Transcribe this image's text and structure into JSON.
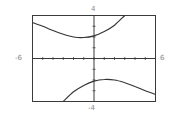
{
  "chart_data": {
    "type": "line",
    "title": "",
    "xlabel": "",
    "ylabel": "",
    "xlim": [
      -6,
      6
    ],
    "ylim": [
      -4,
      4
    ],
    "grid": false,
    "tick_labels": {
      "xmin": "-6",
      "xmax": "6",
      "ymin": "-4",
      "ymax": "4"
    },
    "x_ticks_step": 1,
    "y_ticks_step": 1,
    "series": [
      {
        "name": "upper branch",
        "x": [
          -6,
          -5,
          -4,
          -3,
          -2,
          -1,
          0,
          1,
          2,
          3
        ],
        "y": [
          3.35,
          3.0,
          2.6,
          2.25,
          2.0,
          1.95,
          2.1,
          2.5,
          3.1,
          4.0
        ]
      },
      {
        "name": "lower branch",
        "x": [
          -3,
          -2,
          -1,
          0,
          1,
          2,
          3,
          4,
          5,
          6
        ],
        "y": [
          -4.0,
          -3.1,
          -2.5,
          -2.1,
          -1.95,
          -2.0,
          -2.25,
          -2.6,
          -3.0,
          -3.35
        ]
      }
    ]
  },
  "colors": {
    "frame": "#3a3a3a",
    "curve": "#333333",
    "label": "#8a8a8a"
  }
}
